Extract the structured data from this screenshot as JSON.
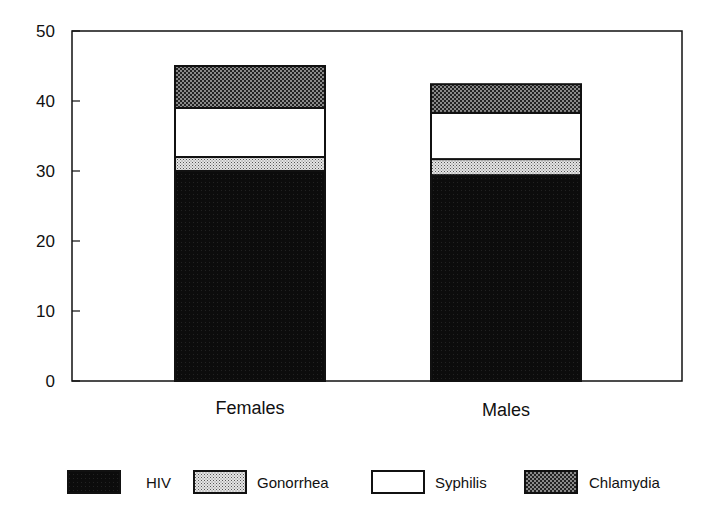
{
  "chart_data": {
    "type": "bar",
    "stacked": true,
    "title": "",
    "xlabel": "",
    "ylabel": "",
    "ylim": [
      0,
      50
    ],
    "yticks": [
      0,
      10,
      20,
      30,
      40,
      50
    ],
    "grid": false,
    "legend_position": "bottom",
    "categories": [
      "Females",
      "Males"
    ],
    "series": [
      {
        "name": "HIV",
        "values": [
          30,
          29.4
        ],
        "pattern": "solid-black"
      },
      {
        "name": "Gonorrhea",
        "values": [
          2,
          2.3
        ],
        "pattern": "light-stipple"
      },
      {
        "name": "Syphilis",
        "values": [
          7,
          6.6
        ],
        "pattern": "white"
      },
      {
        "name": "Chlamydia",
        "values": [
          6,
          4.1
        ],
        "pattern": "dark-checker"
      }
    ],
    "cumulative_tops": {
      "Females": [
        30,
        32,
        39,
        45
      ],
      "Males": [
        29.4,
        31.7,
        38.3,
        42.4
      ]
    }
  },
  "axis": {
    "y_tick_labels": [
      "0",
      "10",
      "20",
      "30",
      "40",
      "50"
    ]
  },
  "legend": {
    "items": [
      {
        "label": "HIV"
      },
      {
        "label": "Gonorrhea"
      },
      {
        "label": "Syphilis"
      },
      {
        "label": "Chlamydia"
      }
    ]
  }
}
